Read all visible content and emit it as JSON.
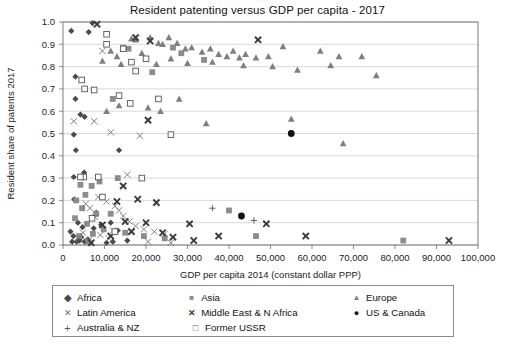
{
  "chart_data": {
    "type": "scatter",
    "title": "Resident patenting versus GDP per capita - 2017",
    "xlabel": "GDP per capita 2014 (constant dollar PPP)",
    "ylabel": "Resident share of patents 2017",
    "xlim": [
      0,
      100000
    ],
    "ylim": [
      0,
      1.0
    ],
    "xticks": [
      0,
      10000,
      20000,
      30000,
      40000,
      50000,
      60000,
      70000,
      80000,
      90000,
      100000
    ],
    "xticklabels": [
      "0",
      "10,000",
      "20,000",
      "30,000",
      "40,000",
      "50,000",
      "60,000",
      "70,000",
      "80,000",
      "90,000",
      "100,000"
    ],
    "yticks": [
      0.0,
      0.1,
      0.2,
      0.3,
      0.4,
      0.5,
      0.6,
      0.7,
      0.8,
      0.9,
      1.0
    ],
    "yticklabels": [
      "0.0",
      "0.1",
      "0.2",
      "0.3",
      "0.4",
      "0.5",
      "0.6",
      "0.7",
      "0.8",
      "0.9",
      "1.0"
    ],
    "grid": "horizontal",
    "legend_position": "bottom",
    "series": [
      {
        "name": "Africa",
        "marker": "diamond",
        "color": "#4a4a4a",
        "points": [
          [
            6200,
            0.955
          ],
          [
            3000,
            0.655
          ],
          [
            3000,
            0.755
          ],
          [
            2600,
            0.495
          ],
          [
            3100,
            0.425
          ],
          [
            2600,
            0.305
          ],
          [
            2700,
            0.205
          ],
          [
            4200,
            0.585
          ],
          [
            5200,
            0.575
          ],
          [
            5100,
            0.325
          ],
          [
            8000,
            0.145
          ],
          [
            13500,
            0.425
          ],
          [
            2200,
            0.015
          ],
          [
            3300,
            0.015
          ],
          [
            4000,
            0.02
          ],
          [
            4400,
            0.035
          ],
          [
            5200,
            0.015
          ],
          [
            6000,
            0.025
          ],
          [
            6600,
            0.01
          ],
          [
            7400,
            0.075
          ],
          [
            9200,
            0.09
          ],
          [
            11500,
            0.1
          ],
          [
            13200,
            0.065
          ],
          [
            15500,
            0.02
          ],
          [
            1800,
            0.06
          ],
          [
            2500,
            0.04
          ],
          [
            3600,
            0.1
          ],
          [
            4700,
            0.08
          ],
          [
            10500,
            0.01
          ],
          [
            12000,
            0.015
          ],
          [
            2000,
            0.96
          ],
          [
            7100,
            0.995
          ]
        ]
      },
      {
        "name": "Asia",
        "marker": "square-filled",
        "color": "#8c8c8c",
        "points": [
          [
            14500,
            0.885
          ],
          [
            15800,
            0.88
          ],
          [
            21500,
            0.775
          ],
          [
            13200,
            0.3
          ],
          [
            8800,
            0.285
          ],
          [
            4200,
            0.27
          ],
          [
            6900,
            0.265
          ],
          [
            5400,
            0.225
          ],
          [
            3200,
            0.2
          ],
          [
            4600,
            0.165
          ],
          [
            8000,
            0.14
          ],
          [
            11500,
            0.14
          ],
          [
            40000,
            0.155
          ],
          [
            46500,
            0.04
          ],
          [
            82000,
            0.02
          ],
          [
            5800,
            0.095
          ],
          [
            9800,
            0.07
          ],
          [
            15000,
            0.055
          ],
          [
            2900,
            0.12
          ],
          [
            7200,
            0.05
          ],
          [
            26500,
            0.885
          ],
          [
            28500,
            0.86
          ],
          [
            34000,
            0.83
          ],
          [
            12000,
            0.655
          ],
          [
            3900,
            0.04
          ],
          [
            6100,
            0.015
          ],
          [
            19500,
            0.04
          ],
          [
            24500,
            0.03
          ]
        ]
      },
      {
        "name": "Europe",
        "marker": "triangle",
        "color": "#7f7f7f",
        "points": [
          [
            13000,
            0.845
          ],
          [
            16500,
            0.925
          ],
          [
            17500,
            0.92
          ],
          [
            21000,
            0.93
          ],
          [
            23000,
            0.905
          ],
          [
            24000,
            0.9
          ],
          [
            25500,
            0.93
          ],
          [
            27500,
            0.905
          ],
          [
            29500,
            0.88
          ],
          [
            31000,
            0.885
          ],
          [
            33500,
            0.865
          ],
          [
            35500,
            0.88
          ],
          [
            37500,
            0.855
          ],
          [
            39500,
            0.845
          ],
          [
            41000,
            0.87
          ],
          [
            42500,
            0.84
          ],
          [
            44000,
            0.855
          ],
          [
            46500,
            0.84
          ],
          [
            49500,
            0.845
          ],
          [
            53000,
            0.89
          ],
          [
            62000,
            0.87
          ],
          [
            66500,
            0.845
          ],
          [
            72000,
            0.845
          ],
          [
            11500,
            0.87
          ],
          [
            19000,
            0.86
          ],
          [
            30000,
            0.815
          ],
          [
            36000,
            0.82
          ],
          [
            43500,
            0.805
          ],
          [
            50500,
            0.8
          ],
          [
            56500,
            0.785
          ],
          [
            64500,
            0.805
          ],
          [
            75500,
            0.76
          ],
          [
            22500,
            0.81
          ],
          [
            26000,
            0.835
          ],
          [
            9500,
            0.825
          ],
          [
            14000,
            0.81
          ],
          [
            28000,
            0.655
          ],
          [
            20500,
            0.615
          ],
          [
            23500,
            0.6
          ],
          [
            55000,
            0.565
          ],
          [
            67500,
            0.455
          ],
          [
            13500,
            0.625
          ],
          [
            10500,
            0.6
          ],
          [
            34500,
            0.545
          ]
        ]
      },
      {
        "name": "Latin America",
        "marker": "x-thin",
        "color": "#6b6b6b",
        "points": [
          [
            9500,
            0.87
          ],
          [
            7500,
            0.555
          ],
          [
            11500,
            0.505
          ],
          [
            18500,
            0.49
          ],
          [
            15500,
            0.315
          ],
          [
            8500,
            0.215
          ],
          [
            10500,
            0.195
          ],
          [
            12500,
            0.175
          ],
          [
            13500,
            0.155
          ],
          [
            14500,
            0.13
          ],
          [
            6500,
            0.165
          ],
          [
            16000,
            0.105
          ],
          [
            17500,
            0.085
          ],
          [
            19500,
            0.07
          ],
          [
            22000,
            0.06
          ],
          [
            24500,
            0.05
          ],
          [
            5500,
            0.185
          ],
          [
            7800,
            0.125
          ],
          [
            4800,
            0.055
          ],
          [
            3800,
            0.03
          ],
          [
            6200,
            0.02
          ],
          [
            9000,
            0.045
          ],
          [
            11000,
            0.03
          ],
          [
            20500,
            0.015
          ],
          [
            26000,
            0.01
          ],
          [
            2600,
            0.555
          ],
          [
            12000,
            0.065
          ]
        ]
      },
      {
        "name": "Middle East & N Africa",
        "marker": "x-bold",
        "color": "#3a3a3a",
        "points": [
          [
            8200,
            0.99
          ],
          [
            17500,
            0.93
          ],
          [
            21000,
            0.915
          ],
          [
            47000,
            0.92
          ],
          [
            20500,
            0.56
          ],
          [
            14500,
            0.265
          ],
          [
            18000,
            0.205
          ],
          [
            13000,
            0.195
          ],
          [
            20000,
            0.1
          ],
          [
            30500,
            0.095
          ],
          [
            49000,
            0.095
          ],
          [
            37500,
            0.04
          ],
          [
            58500,
            0.04
          ],
          [
            93000,
            0.02
          ],
          [
            9500,
            0.09
          ],
          [
            16500,
            0.06
          ],
          [
            11500,
            0.04
          ],
          [
            24000,
            0.055
          ],
          [
            26500,
            0.035
          ],
          [
            6800,
            0.01
          ],
          [
            22500,
            0.19
          ],
          [
            15000,
            0.105
          ],
          [
            31500,
            0.02
          ]
        ]
      },
      {
        "name": "US & Canada",
        "marker": "circle-filled",
        "color": "#111111",
        "points": [
          [
            55000,
            0.5
          ],
          [
            43000,
            0.13
          ]
        ]
      },
      {
        "name": "Australia & NZ",
        "marker": "plus",
        "color": "#5a5a5a",
        "points": [
          [
            36000,
            0.165
          ],
          [
            46000,
            0.11
          ]
        ]
      },
      {
        "name": "Former USSR",
        "marker": "square-open",
        "color": "#555555",
        "points": [
          [
            10500,
            0.945
          ],
          [
            10500,
            0.9
          ],
          [
            14500,
            0.88
          ],
          [
            4500,
            0.74
          ],
          [
            5200,
            0.7
          ],
          [
            7500,
            0.695
          ],
          [
            16500,
            0.82
          ],
          [
            20000,
            0.835
          ],
          [
            17500,
            0.78
          ],
          [
            16200,
            0.635
          ],
          [
            13500,
            0.67
          ],
          [
            23000,
            0.655
          ],
          [
            5000,
            0.305
          ],
          [
            8500,
            0.305
          ],
          [
            19000,
            0.3
          ],
          [
            9500,
            0.215
          ],
          [
            4200,
            0.305
          ],
          [
            26000,
            0.495
          ],
          [
            12500,
            0.06
          ],
          [
            7000,
            0.12
          ]
        ]
      }
    ]
  },
  "legend": {
    "rows": [
      [
        {
          "label": "Africa",
          "marker": "diamond"
        },
        {
          "label": "Asia",
          "marker": "square-filled"
        },
        {
          "label": "Europe",
          "marker": "triangle"
        }
      ],
      [
        {
          "label": "Latin America",
          "marker": "x-thin"
        },
        {
          "label": "Middle East & N Africa",
          "marker": "x-bold"
        },
        {
          "label": "US & Canada",
          "marker": "circle-filled"
        }
      ],
      [
        {
          "label": "Australia & NZ",
          "marker": "plus"
        },
        {
          "label": "Former USSR",
          "marker": "square-open"
        }
      ]
    ]
  }
}
